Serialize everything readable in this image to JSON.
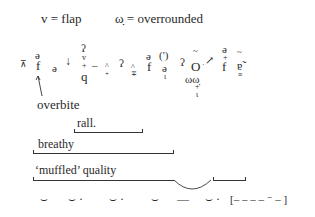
{
  "legend": {
    "flap": "v = flap",
    "overrounded": "ω̣ = overrounded"
  },
  "transcription": {
    "s1": "⊼",
    "s2_top": "ə",
    "s2": "f",
    "s3": "ə",
    "s4": "↓",
    "s5_top": "ʔ",
    "s5_mid": "v",
    "s5_plus": "+",
    "s5": "q",
    "s6": "–",
    "s7": "^",
    "s7_plus": "+",
    "s8": "ʔ",
    "s9": "^",
    "s9_plus": "∓",
    "s10_top": "ə",
    "s10": "f",
    "s11": "(')",
    "s11_low": "ə",
    "s11_sub": "ɩ",
    "s12": "ʔ",
    "s13_tilde": "~",
    "s13": "O",
    "s13_dot": "·",
    "s13_low": "ωω̣",
    "s13_plus": "+",
    "s13_sub": "ɩ",
    "s14": "↗",
    "s15_top": "ə",
    "s15_plus": "+",
    "s15": "f",
    "s16_tilde": "~",
    "s16": "ɐ̃",
    "s16_under": "≡"
  },
  "annotations": {
    "overbite": "overbite",
    "rall": "rall.",
    "breathy": "breathy",
    "muffled": "‘muffled’ quality"
  },
  "rhythm": {
    "marks": [
      "⌣",
      "⌣ ·",
      "⌣ ·",
      "⌣",
      "—",
      "⌣ ·",
      "[– – – – ⁻ – ]"
    ]
  }
}
